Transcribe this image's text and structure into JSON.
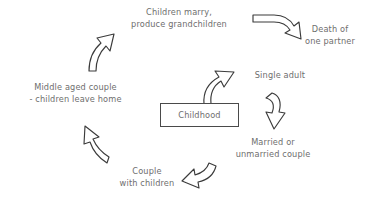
{
  "diagram": {
    "title_text": "",
    "background_color": "#ffffff",
    "text_color": "#6e6e6e",
    "stroke_color": "#3b3b3b",
    "box_border_color": "#4a4a4a",
    "center_node": {
      "label": "Childhood"
    },
    "stages": [
      {
        "id": "single-adult",
        "label": "Single adult"
      },
      {
        "id": "married-couple",
        "label": "Married or\nunmarried couple"
      },
      {
        "id": "couple-children",
        "label": "Couple\nwith children"
      },
      {
        "id": "middle-aged-couple",
        "label": "Middle aged couple\n- children leave home"
      },
      {
        "id": "children-marry",
        "label": "Children marry,\nproduce grandchildren"
      },
      {
        "id": "death-partner",
        "label": "Death of\none partner"
      }
    ],
    "arrows": [
      {
        "id": "arrow-childhood-to-single-adult",
        "name": "curved-arrow-up-right-icon"
      },
      {
        "id": "arrow-single-adult-to-married",
        "name": "curved-arrow-down-icon"
      },
      {
        "id": "arrow-married-to-couple",
        "name": "curved-arrow-down-left-icon"
      },
      {
        "id": "arrow-couple-to-middle-aged",
        "name": "curved-arrow-up-left-icon"
      },
      {
        "id": "arrow-middle-aged-to-marry",
        "name": "curved-arrow-up-icon"
      },
      {
        "id": "arrow-marry-to-death",
        "name": "curved-arrow-right-down-icon"
      }
    ]
  }
}
